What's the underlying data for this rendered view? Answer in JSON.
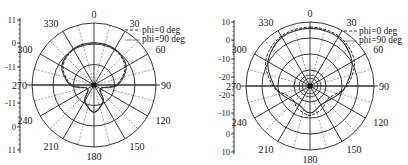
{
  "chart_data": [
    {
      "type": "polar",
      "title": "",
      "angle_ticks": [
        "0",
        "30",
        "60",
        "90",
        "120",
        "150",
        "180",
        "210",
        "240",
        "270",
        "300",
        "330"
      ],
      "radial_scale_labels": [
        "11",
        "0",
        "-11",
        "-11",
        "0",
        "11"
      ],
      "rings": 4,
      "grid": true,
      "legend_position": "upper-right",
      "series": [
        {
          "name": "phi=0 deg",
          "style": "dashed",
          "description": "main forward lobe toward 0 deg with small back lobe at 180 deg",
          "angles": [
            0,
            30,
            60,
            90,
            120,
            150,
            180,
            210,
            240,
            270,
            300,
            330
          ],
          "radius_frac": [
            0.68,
            0.66,
            0.58,
            0.36,
            0.12,
            0.3,
            0.44,
            0.3,
            0.12,
            0.36,
            0.58,
            0.66
          ]
        },
        {
          "name": "phi=90 deg",
          "style": "solid",
          "description": "near-identical forward lobe, small back lobe",
          "angles": [
            0,
            30,
            60,
            90,
            120,
            150,
            180,
            210,
            240,
            270,
            300,
            330
          ],
          "radius_frac": [
            0.68,
            0.67,
            0.6,
            0.38,
            0.12,
            0.3,
            0.44,
            0.3,
            0.12,
            0.38,
            0.6,
            0.67
          ]
        }
      ]
    },
    {
      "type": "polar",
      "title": "",
      "angle_ticks": [
        "0",
        "30",
        "60",
        "90",
        "120",
        "150",
        "180",
        "210",
        "240",
        "270",
        "300",
        "330"
      ],
      "radial_scale_labels": [
        "10",
        "0",
        "-10",
        "-20",
        "-20",
        "-10",
        "0",
        "10"
      ],
      "rings": 4,
      "grid": true,
      "legend_position": "upper-right",
      "series": [
        {
          "name": "phi=0 deg",
          "style": "dashed",
          "description": "broad forward lobe near outer ring, rippled side/back lobes",
          "angles": [
            0,
            30,
            60,
            90,
            110,
            130,
            150,
            170,
            180,
            190,
            210,
            230,
            250,
            270,
            300,
            330
          ],
          "radius_frac": [
            0.92,
            0.9,
            0.8,
            0.58,
            0.4,
            0.34,
            0.4,
            0.44,
            0.46,
            0.44,
            0.4,
            0.34,
            0.4,
            0.58,
            0.8,
            0.9
          ]
        },
        {
          "name": "phi=90 deg",
          "style": "solid",
          "description": "similar forward lobe slightly narrower, rippled back",
          "angles": [
            0,
            30,
            60,
            90,
            110,
            130,
            150,
            170,
            180,
            190,
            210,
            230,
            250,
            270,
            300,
            330
          ],
          "radius_frac": [
            0.9,
            0.88,
            0.76,
            0.56,
            0.44,
            0.36,
            0.34,
            0.4,
            0.42,
            0.4,
            0.34,
            0.36,
            0.44,
            0.56,
            0.76,
            0.88
          ]
        }
      ]
    }
  ],
  "left": {
    "angle_labels": [
      "0",
      "30",
      "60",
      "90",
      "120",
      "150",
      "180",
      "210",
      "240",
      "270",
      "300",
      "330"
    ],
    "scale_labels": [
      "11",
      "0",
      "-11",
      "-11",
      "0",
      "11"
    ],
    "legend": [
      "phi=0 deg",
      "phi=90 deg"
    ]
  },
  "right": {
    "angle_labels": [
      "0",
      "30",
      "60",
      "90",
      "120",
      "150",
      "180",
      "210",
      "240",
      "270",
      "300",
      "330"
    ],
    "scale_labels": [
      "10",
      "0",
      "-10",
      "-20",
      "-20",
      "-10",
      "0",
      "10"
    ],
    "legend": [
      "phi=0 deg",
      "phi=90 deg"
    ]
  },
  "colors": {
    "ink": "#222222",
    "grid_dash": "#555555",
    "background": "#ffffff"
  }
}
